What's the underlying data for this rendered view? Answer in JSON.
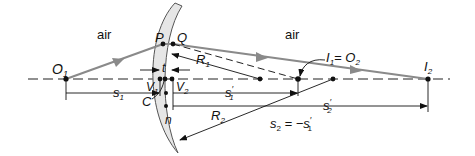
{
  "diagram": {
    "type": "thick-lens-ray-diagram",
    "colors": {
      "ray": "#8a8a8a",
      "ink": "#111111",
      "lens_fill": "#e6e6e6",
      "lens_edge": "#555555",
      "background": "#ffffff"
    },
    "media": {
      "left": "air",
      "right": "air",
      "lens_index": "n"
    },
    "points": {
      "object": {
        "label": "O",
        "sub": "1"
      },
      "P": {
        "label": "P"
      },
      "Q": {
        "label": "Q"
      },
      "V1": {
        "label": "V",
        "sub": "1"
      },
      "V2": {
        "label": "V",
        "sub": "2"
      },
      "C": {
        "label": "C"
      },
      "intermediate_image": {
        "label": "I",
        "sub": "1",
        "eq": "= O",
        "eq_sub": "2"
      },
      "final_image": {
        "label": "I",
        "sub": "2"
      }
    },
    "dimensions": {
      "thickness": "t",
      "R1": {
        "label": "R",
        "sub": "1"
      },
      "R2": {
        "label": "R",
        "sub": "2"
      },
      "s1": {
        "label": "s",
        "sub": "1"
      },
      "s1_prime": {
        "label": "s",
        "sub": "1",
        "prime": "′"
      },
      "s2_prime": {
        "label": "s",
        "sub": "2",
        "prime": "′"
      },
      "relation": {
        "lhs": "s",
        "lhs_sub": "2",
        "op": " = −s",
        "rhs_sub": "1",
        "prime": "′"
      }
    }
  }
}
